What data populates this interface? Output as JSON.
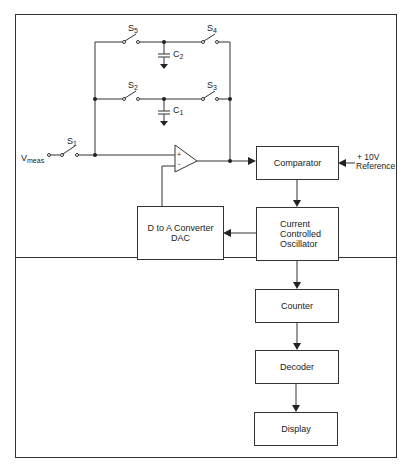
{
  "diagram": {
    "input_label": "V",
    "input_sub": "meas",
    "switches": [
      {
        "id": "S1",
        "label": "S",
        "sub": "1"
      },
      {
        "id": "S2",
        "label": "S",
        "sub": "2"
      },
      {
        "id": "S3",
        "label": "S",
        "sub": "3"
      },
      {
        "id": "S4",
        "label": "S",
        "sub": "4"
      },
      {
        "id": "S5",
        "label": "S",
        "sub": "5"
      }
    ],
    "capacitors": [
      {
        "id": "C1",
        "label": "C",
        "sub": "1"
      },
      {
        "id": "C2",
        "label": "C",
        "sub": "2"
      }
    ],
    "opamp": {
      "plus": "+",
      "minus": "-"
    },
    "blocks": {
      "comparator": "Comparator",
      "reference_line1": "+ 10V",
      "reference_line2": "Reference",
      "dac_line1": "D to A Converter",
      "dac_line2": "DAC",
      "cco_line1": "Current",
      "cco_line2": "Controlled",
      "cco_line3": "Oscillator",
      "counter": "Counter",
      "decoder": "Decoder",
      "display": "Display"
    },
    "colors": {
      "line": "#333333",
      "background": "#ffffff"
    }
  }
}
